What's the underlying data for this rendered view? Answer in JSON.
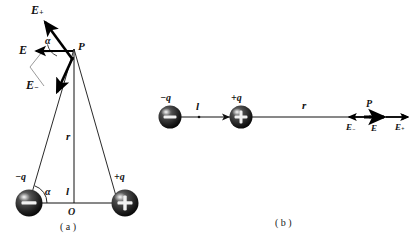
{
  "figure": {
    "background_color": "#ffffff",
    "ink_color": "#111111",
    "captions": {
      "panel_a": "( a )",
      "panel_b": "( b )"
    }
  },
  "panel_a": {
    "name": "perpendicular-bisector-case",
    "charges": [
      {
        "id": "negative",
        "label_main": "−q",
        "sign_glyph": "−"
      },
      {
        "id": "positive",
        "label_main": "+q",
        "sign_glyph": "+"
      }
    ],
    "point_label": "P",
    "origin_label": "O",
    "distance_r": "r",
    "distance_l": "l",
    "angle_at_p": "α",
    "angle_at_charge": "α",
    "field_vectors": [
      {
        "id": "e-plus",
        "base": "E",
        "sub": "+",
        "direction": "up-left"
      },
      {
        "id": "e-minus",
        "base": "E",
        "sub": "−",
        "direction": "down-left"
      },
      {
        "id": "e-resultant",
        "base": "E",
        "sub": "",
        "direction": "left"
      }
    ]
  },
  "panel_b": {
    "name": "axial-case",
    "charges": [
      {
        "id": "negative",
        "label_main": "−q",
        "sign_glyph": "−"
      },
      {
        "id": "positive",
        "label_main": "+q",
        "sign_glyph": "+"
      }
    ],
    "point_label": "P",
    "distance_r": "r",
    "distance_l": "l",
    "field_vectors": [
      {
        "id": "e-minus",
        "base": "E",
        "sub": "−",
        "direction": "left"
      },
      {
        "id": "e-resultant",
        "base": "E",
        "sub": "",
        "direction": "right"
      },
      {
        "id": "e-plus",
        "base": "E",
        "sub": "+",
        "direction": "right"
      }
    ]
  }
}
